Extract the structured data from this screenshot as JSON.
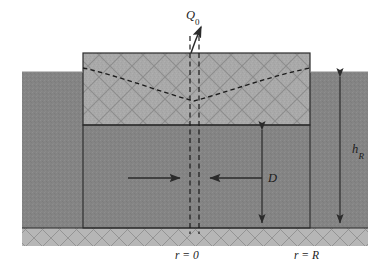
{
  "figure": {
    "type": "technical-cross-section-diagram",
    "background_color": "#ffffff"
  },
  "colors": {
    "aquifer_dark_gray": "#848484",
    "upper_block_light_gray": "#a9a9a9",
    "bedrock_band_gray": "#b4b4b4",
    "hatch_line": "#8e8e8e",
    "outline": "#2b2b2b",
    "dashed_line": "#1c1c1c",
    "arrow": "#2b2b2b"
  },
  "labels": {
    "discharge": {
      "base": "Q",
      "subscript": "0",
      "full": "Q0"
    },
    "reservoir_height": {
      "base": "h",
      "subscript": "R",
      "full": "hR"
    },
    "aquifer_thickness": {
      "base": "D",
      "subscript": "",
      "full": "D"
    },
    "radius_center": {
      "full": "r = 0"
    },
    "radius_outer": {
      "full": "r = R"
    }
  },
  "geometry": {
    "canvas": {
      "width": 391,
      "height": 273
    },
    "outer_ground": {
      "x": 22,
      "y": 72,
      "width": 346,
      "height": 156
    },
    "upper_block": {
      "x": 83,
      "y": 53,
      "width": 227,
      "height": 72
    },
    "lower_aquifer": {
      "x": 83,
      "y": 125,
      "width": 227,
      "height": 103
    },
    "bedrock_band": {
      "x": 22,
      "y": 228,
      "width": 346,
      "height": 18
    },
    "interface_y": 125,
    "base_y": 228,
    "well_axis_left_x": 190,
    "well_axis_right_x": 199
  },
  "annotations": {
    "drawdown_curve": {
      "description": "dashed V-shaped water-table drawdown cone",
      "left_edge_y": 68,
      "center_y": 101,
      "right_edge_y": 68
    },
    "flow_arrows": [
      {
        "name": "flow-arrow-left",
        "direction": "right",
        "x1": 128,
        "x2": 178,
        "y": 178
      },
      {
        "name": "flow-arrow-right",
        "direction": "left",
        "x1": 262,
        "x2": 212,
        "y": 178
      }
    ],
    "dimension_lines": [
      {
        "name": "dimension-hr",
        "x": 340,
        "y_top": 72,
        "y_bottom": 228
      },
      {
        "name": "dimension-d",
        "x": 262,
        "y_top": 125,
        "y_bottom": 228
      }
    ],
    "discharge_arrow": {
      "from_x": 191,
      "from_y": 53,
      "to_x": 201,
      "to_y": 24
    }
  }
}
